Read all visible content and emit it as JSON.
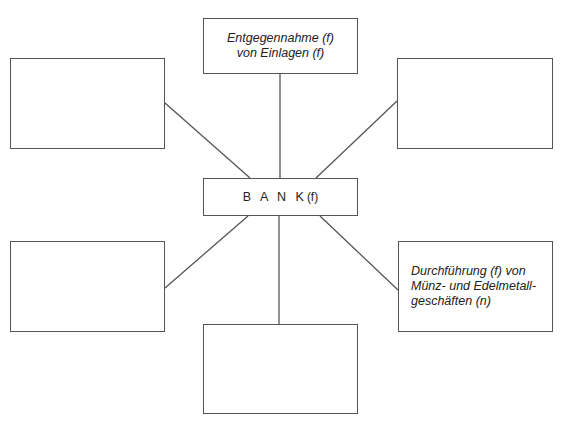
{
  "diagram": {
    "center": {
      "label": "B A N K",
      "suffix": "(f)"
    },
    "nodes": {
      "top": {
        "line1": "Entgegennahme (f)",
        "line2": "von Einlagen (f)"
      },
      "top_left": {
        "text": ""
      },
      "top_right": {
        "text": ""
      },
      "bottom_left": {
        "text": ""
      },
      "bottom_right": {
        "line1": "Durchführung (f) von",
        "line2": "Münz- und Edelmetall-",
        "line3": "geschäften (n)"
      },
      "bottom": {
        "text": ""
      }
    },
    "colors": {
      "stroke": "#555555",
      "background": "#ffffff"
    }
  }
}
